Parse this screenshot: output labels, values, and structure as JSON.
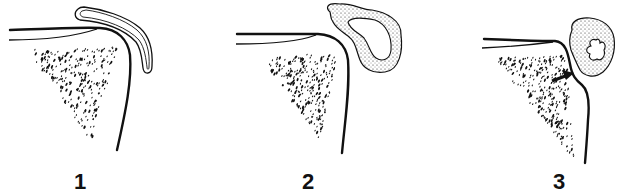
{
  "figure": {
    "panels": [
      {
        "label": "1",
        "stage": "normal bursa (thin-walled, empty)"
      },
      {
        "label": "2",
        "stage": "thickened bursa wall"
      },
      {
        "label": "3",
        "stage": "bursa with erosion of adjacent bone (arrow)"
      }
    ],
    "colors": {
      "ink": "#111111",
      "background": "#ffffff"
    }
  }
}
